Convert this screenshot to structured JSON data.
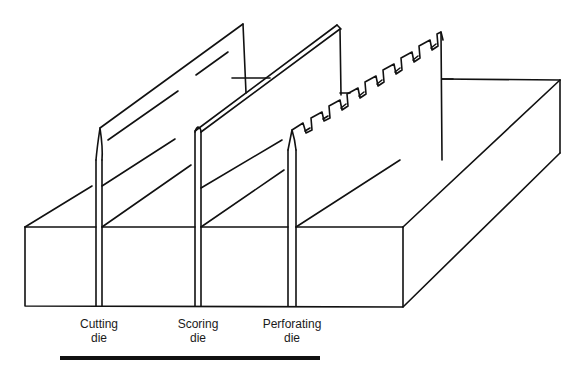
{
  "figure": {
    "type": "isometric line drawing",
    "stroke_color": "#111111",
    "fill_color": "#ffffff"
  },
  "labels": [
    {
      "id": "cutting",
      "line1": "Cutting",
      "line2": "die"
    },
    {
      "id": "scoring",
      "line1": "Scoring",
      "line2": "die"
    },
    {
      "id": "perforating",
      "line1": "Perforating",
      "line2": "die"
    }
  ],
  "rule": {
    "color": "#111111"
  }
}
